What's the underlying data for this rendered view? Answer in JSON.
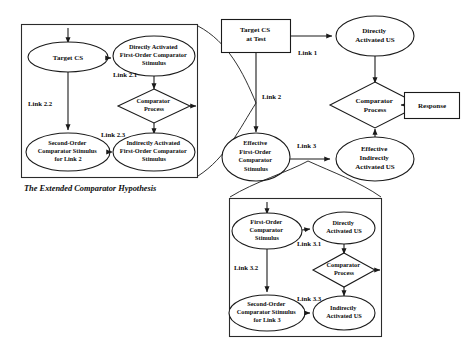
{
  "figure": {
    "caption": "The Extended Comparator Hypothesis",
    "background_color": "#ffffff",
    "ink_color": "#1a1a1a"
  },
  "main_diagram": {
    "nodes": {
      "target_cs_at_test": "Target CS\nat Test",
      "directly_activated_us": "Directly\nActivated US",
      "comparator_process": "Comparator\nProcess",
      "response": "Response",
      "effective_first_order_comparator_stimulus": "Effective\nFirst-Order\nComparator\nStimulus",
      "effective_indirectly_activated_us": "Effective\nIndirectly\nActivated US"
    },
    "links": {
      "link_1": "Link 1",
      "link_2": "Link 2",
      "link_3": "Link 3"
    }
  },
  "left_panel": {
    "nodes": {
      "target_cs": "Target CS",
      "directly_activated_first_order_comparator_stimulus": "Directly Activated\nFirst-Order Comparator\nStimulus",
      "comparator_process": "Comparator\nProcess",
      "second_order_comparator_stimulus_for_link_2": "Second-Order\nComparator Stimulus\nfor Link 2",
      "indirectly_activated_first_order_comparator_stimulus": "Indirectly Activated\nFirst-Order Comparator\nStimulus"
    },
    "links": {
      "link_2_1": "Link 2.1",
      "link_2_2": "Link 2.2",
      "link_2_3": "Link 2.3"
    }
  },
  "bottom_panel": {
    "nodes": {
      "first_order_comparator_stimulus": "First-Order\nComparator\nStimulus",
      "directly_activated_us": "Directly\nActivated US",
      "comparator_process": "Comparator\nProcess",
      "second_order_comparator_stimulus_for_link_3": "Second-Order\nComparator Stimulus\nfor Link 3",
      "indirectly_activated_us": "Indirectly\nActivated US"
    },
    "links": {
      "link_3_1": "Link 3.1",
      "link_3_2": "Link 3.2",
      "link_3_3": "Link 3.3"
    }
  }
}
